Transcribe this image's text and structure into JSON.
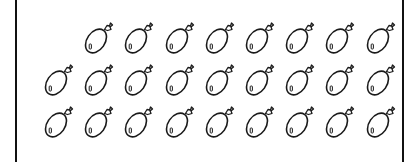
{
  "figure": {
    "rows": [
      {
        "label": "row-1",
        "count": 8,
        "start_column": 1
      },
      {
        "label": "row-2",
        "count": 9,
        "start_column": 0
      },
      {
        "label": "row-3",
        "count": 9,
        "start_column": 0
      }
    ],
    "total_balloons": 26,
    "icon": "balloon-icon",
    "colors": {
      "stroke": "#1a1a1a",
      "frame": "#111111",
      "background": "#ffffff"
    }
  }
}
